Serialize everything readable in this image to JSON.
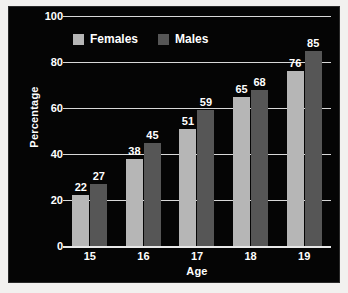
{
  "chart_data": {
    "type": "bar",
    "title": "",
    "xlabel": "Age",
    "ylabel": "Percentage",
    "categories": [
      "15",
      "16",
      "17",
      "18",
      "19"
    ],
    "series": [
      {
        "name": "Females",
        "color": "#b6b6b6",
        "values": [
          22,
          38,
          51,
          65,
          76
        ]
      },
      {
        "name": "Males",
        "color": "#565656",
        "values": [
          27,
          45,
          59,
          68,
          85
        ]
      }
    ],
    "ylim": [
      0,
      100
    ],
    "yticks": [
      0,
      20,
      40,
      60,
      80,
      100
    ],
    "ytick_labels": [
      "0",
      "20",
      "40",
      "60",
      "80",
      "100"
    ],
    "grid": true,
    "legend_position": "top-left-inside",
    "background_color": "#050505",
    "gridline_color": "#d8d8d8",
    "text_color": "#ffffff"
  },
  "axes": {
    "y_title": "Percentage",
    "x_title": "Age"
  },
  "legend": {
    "entries": [
      {
        "label": "Females",
        "swatch": "legend-swatch-females"
      },
      {
        "label": "Males",
        "swatch": "legend-swatch-males"
      }
    ]
  }
}
